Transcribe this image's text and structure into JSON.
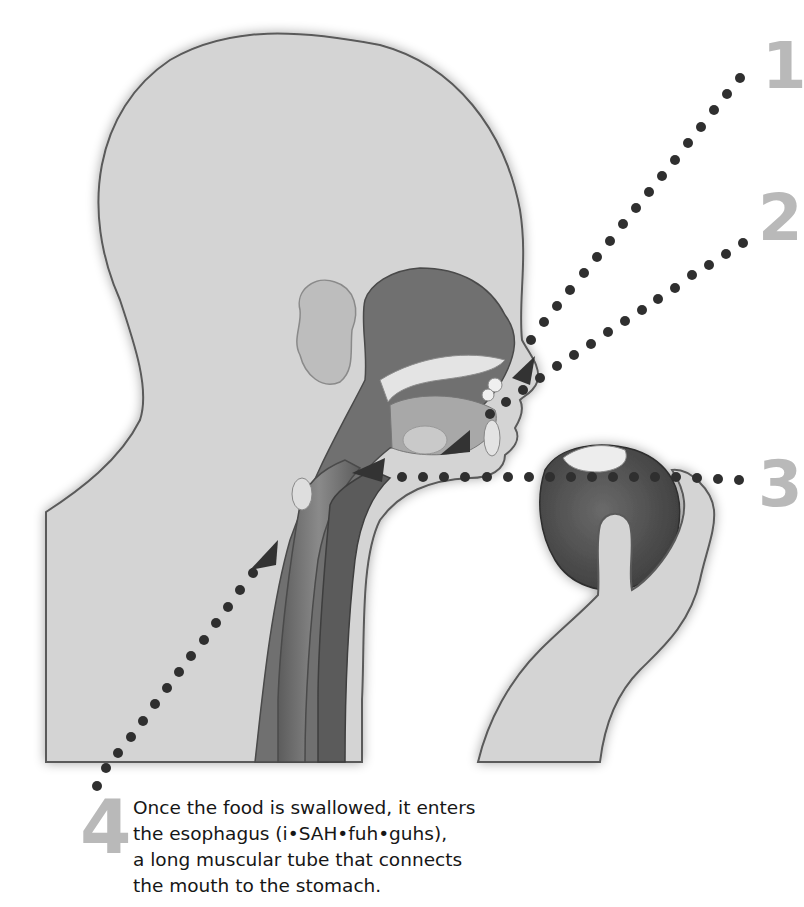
{
  "diagram": {
    "callouts": [
      {
        "number": "1",
        "target": "mouth-teeth"
      },
      {
        "number": "2",
        "target": "tongue"
      },
      {
        "number": "3",
        "target": "throat-pharynx"
      },
      {
        "number": "4",
        "target": "esophagus"
      }
    ],
    "colors": {
      "skin_fill": "#d4d4d4",
      "outline": "#5a5a5a",
      "cavity_dark": "#6e6e6e",
      "dots": "#2f2f2f",
      "numbers": "#b9b9b9",
      "text": "#161616",
      "background": "#ffffff"
    }
  },
  "caption": {
    "lines": [
      "Once the food is swallowed, it enters",
      "the esophagus (i•SAH•fuh•guhs),",
      "a long muscular tube that connects",
      "the mouth to the stomach."
    ]
  }
}
